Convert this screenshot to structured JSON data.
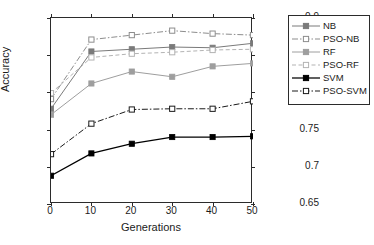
{
  "chart_data": {
    "type": "line",
    "title": "",
    "xlabel": "Generations",
    "ylabel": "Accuracy",
    "x": [
      0,
      10,
      20,
      30,
      40,
      50
    ],
    "xlim": [
      0,
      50
    ],
    "ylim": [
      0.65,
      0.9
    ],
    "xticks": [
      "0",
      "10",
      "20",
      "30",
      "40",
      "50"
    ],
    "yticks": [
      "0.65",
      "0.7",
      "0.75",
      "0.8",
      "0.85",
      "0.9"
    ],
    "grid": false,
    "legend_position": "outside-right-top",
    "series": [
      {
        "name": "NB",
        "values": [
          0.778,
          0.855,
          0.858,
          0.861,
          0.86,
          0.866
        ],
        "color": "#7a7a7a",
        "linestyle": "solid",
        "marker": "filled-square"
      },
      {
        "name": "PSO-NB",
        "values": [
          0.791,
          0.871,
          0.877,
          0.883,
          0.879,
          0.877
        ],
        "color": "#8d8d8d",
        "linestyle": "dash-dot",
        "marker": "open-square"
      },
      {
        "name": "RF",
        "values": [
          0.77,
          0.812,
          0.828,
          0.821,
          0.835,
          0.839
        ],
        "color": "#9e9e9e",
        "linestyle": "solid",
        "marker": "filled-square"
      },
      {
        "name": "PSO-RF",
        "values": [
          0.799,
          0.847,
          0.852,
          0.854,
          0.857,
          0.858
        ],
        "color": "#b3b3b3",
        "linestyle": "dashed",
        "marker": "open-square"
      },
      {
        "name": "SVM",
        "values": [
          0.688,
          0.718,
          0.731,
          0.74,
          0.74,
          0.741
        ],
        "color": "#000000",
        "linestyle": "solid",
        "marker": "filled-square"
      },
      {
        "name": "PSO-SVM",
        "values": [
          0.717,
          0.758,
          0.777,
          0.778,
          0.778,
          0.788
        ],
        "color": "#1a1a1a",
        "linestyle": "dash-dot",
        "marker": "open-square"
      }
    ]
  },
  "axes": {
    "y_title": "Accuracy",
    "x_title": "Generations"
  },
  "legend": {
    "entries": [
      {
        "label": "NB"
      },
      {
        "label": "PSO-NB"
      },
      {
        "label": "RF"
      },
      {
        "label": "PSO-RF"
      },
      {
        "label": "SVM"
      },
      {
        "label": "PSO-SVM"
      }
    ]
  }
}
